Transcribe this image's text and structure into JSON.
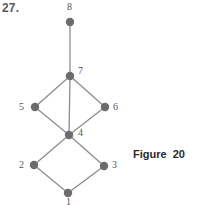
{
  "problem_number": "27.",
  "caption": "Figure 20",
  "colors": {
    "node": "#6c6c6c",
    "edge": "#8c8c8c",
    "label": "#555555",
    "caption": "#2a2a2a"
  },
  "graph": {
    "nodes": [
      {
        "id": "1",
        "label": "1",
        "x": 68,
        "y": 193,
        "lx": 66,
        "ly": 205
      },
      {
        "id": "2",
        "label": "2",
        "x": 34,
        "y": 165,
        "lx": 19,
        "ly": 168
      },
      {
        "id": "3",
        "label": "3",
        "x": 104,
        "y": 166,
        "lx": 112,
        "ly": 168
      },
      {
        "id": "4",
        "label": "4",
        "x": 69,
        "y": 135,
        "lx": 78,
        "ly": 136
      },
      {
        "id": "5",
        "label": "5",
        "x": 35,
        "y": 107,
        "lx": 19,
        "ly": 110
      },
      {
        "id": "6",
        "label": "6",
        "x": 105,
        "y": 107,
        "lx": 113,
        "ly": 110
      },
      {
        "id": "7",
        "label": "7",
        "x": 70,
        "y": 76,
        "lx": 78,
        "ly": 74
      },
      {
        "id": "8",
        "label": "8",
        "x": 70,
        "y": 22,
        "lx": 67,
        "ly": 10
      }
    ],
    "edges": [
      [
        "1",
        "2"
      ],
      [
        "1",
        "3"
      ],
      [
        "2",
        "4"
      ],
      [
        "3",
        "4"
      ],
      [
        "4",
        "5"
      ],
      [
        "4",
        "6"
      ],
      [
        "4",
        "7"
      ],
      [
        "5",
        "7"
      ],
      [
        "6",
        "7"
      ],
      [
        "7",
        "8"
      ]
    ]
  }
}
